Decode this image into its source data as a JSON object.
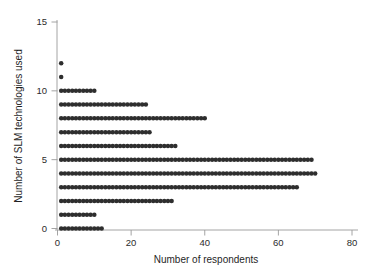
{
  "chart_data": {
    "type": "scatter",
    "title": "",
    "xlabel": "Number of respondents",
    "ylabel": "Number of SLM technologies used",
    "xlim": [
      0,
      82
    ],
    "ylim": [
      -0.6,
      15.6
    ],
    "xticks": [
      0,
      20,
      40,
      60,
      80
    ],
    "yticks": [
      0,
      5,
      10,
      15
    ],
    "xticklabels": [
      "0",
      "20",
      "40",
      "60",
      "80"
    ],
    "yticklabels": [
      "0",
      "5",
      "10",
      "15"
    ],
    "grid": false,
    "legend": false,
    "marker": "filled-circle",
    "marker_color": "#2e2e2e",
    "rows": [
      {
        "y": 0,
        "x_min": 1,
        "x_max": 12
      },
      {
        "y": 1,
        "x_min": 1,
        "x_max": 10
      },
      {
        "y": 2,
        "x_min": 1,
        "x_max": 31
      },
      {
        "y": 3,
        "x_min": 1,
        "x_max": 65
      },
      {
        "y": 4,
        "x_min": 1,
        "x_max": 70
      },
      {
        "y": 5,
        "x_min": 1,
        "x_max": 69
      },
      {
        "y": 6,
        "x_min": 1,
        "x_max": 32
      },
      {
        "y": 7,
        "x_min": 1,
        "x_max": 25
      },
      {
        "y": 8,
        "x_min": 1,
        "x_max": 40
      },
      {
        "y": 9,
        "x_min": 1,
        "x_max": 24
      },
      {
        "y": 10,
        "x_min": 1,
        "x_max": 10
      },
      {
        "y": 11,
        "x_min": 1,
        "x_max": 1
      },
      {
        "y": 12,
        "x_min": 1,
        "x_max": 1
      }
    ],
    "counts_by_technologies_used": {
      "0": 12,
      "1": 10,
      "2": 31,
      "3": 65,
      "4": 70,
      "5": 69,
      "6": 32,
      "7": 25,
      "8": 40,
      "9": 24,
      "10": 10,
      "11": 1,
      "12": 1
    }
  }
}
